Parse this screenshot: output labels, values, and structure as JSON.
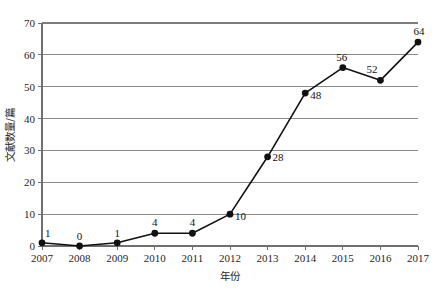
{
  "chart_data": {
    "type": "line",
    "title": "",
    "subtitle": "",
    "xlabel": "年份",
    "ylabel": "文献数量/篇",
    "categories": [
      "2007",
      "2008",
      "2009",
      "2010",
      "2011",
      "2012",
      "2013",
      "2014",
      "2015",
      "2016",
      "2017"
    ],
    "x": [
      2007,
      2008,
      2009,
      2010,
      2011,
      2012,
      2013,
      2014,
      2015,
      2016,
      2017
    ],
    "values": [
      1,
      0,
      1,
      4,
      4,
      10,
      28,
      48,
      56,
      52,
      64
    ],
    "point_labels": [
      "1",
      "0",
      "1",
      "4",
      "4",
      "10",
      "28",
      "48",
      "56",
      "52",
      "64"
    ],
    "xlim": [
      2007,
      2017
    ],
    "ylim": [
      0,
      70
    ],
    "yticks": [
      0,
      10,
      20,
      30,
      40,
      50,
      60,
      70
    ],
    "ytick_labels": [
      "0",
      "10",
      "20",
      "30",
      "40",
      "50",
      "60",
      "70"
    ],
    "xticks": [
      2007,
      2008,
      2009,
      2010,
      2011,
      2012,
      2013,
      2014,
      2015,
      2016,
      2017
    ],
    "grid": "horizontal",
    "legend": "none",
    "legend_position": "none",
    "marker": "filled-circle",
    "line_color": "#111111",
    "marker_color": "#111111",
    "grid_color": "#8a8a8a",
    "background_color": "#ffffff"
  },
  "axes": {
    "y_axis_title": "文献数量/篇",
    "x_axis_title": "年份"
  }
}
